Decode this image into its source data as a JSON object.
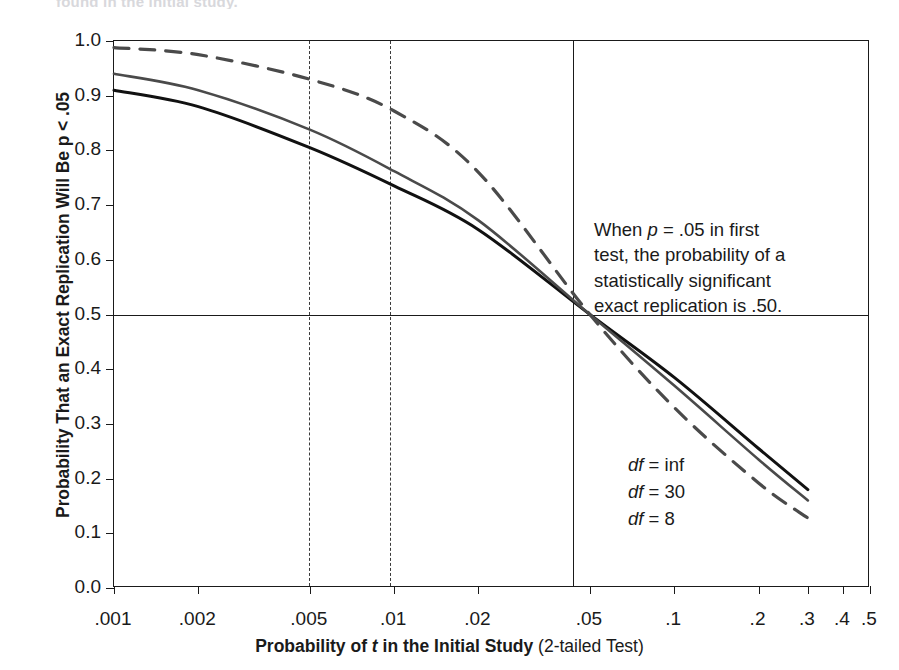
{
  "figure": {
    "cropped_top_text": "found in the initial study.",
    "annotation": "When p = .05 in first\ntest, the probability of a\nstatistically significant\nexact replication is .50.",
    "annotation_lead": "When ",
    "annotation_p": "p",
    "annotation_rest": " = .05 in first\ntest, the probability of a\nstatistically significant\nexact replication is .50."
  },
  "axis_titles": {
    "x_bold": "Probability of ",
    "x_italic": "t",
    "x_bold2": " in the Initial Study",
    "x_plain": " (2-tailed Test)",
    "y": "Probability That an Exact Replication Will Be p < .05"
  },
  "series_labels": {
    "inf": {
      "df": "df",
      "eq": " = inf"
    },
    "d30": {
      "df": "df",
      "eq": " = 30"
    },
    "d8": {
      "df": "df",
      "eq": " = 8"
    }
  },
  "chart_data": {
    "type": "line",
    "title": "",
    "xlabel": "Probability of t in the Initial Study (2-tailed Test)",
    "ylabel": "Probability That an Exact Replication Will Be p < .05",
    "xscale": "log",
    "xlim": [
      0.001,
      0.5
    ],
    "ylim": [
      0.0,
      1.0
    ],
    "grid": false,
    "legend_position": "inline-right-end",
    "x_tick_labels": [
      ".001",
      ".002",
      ".005",
      ".01",
      ".02",
      ".05",
      ".1",
      ".2",
      ".3",
      ".4",
      ".5"
    ],
    "x_tick_values": [
      0.001,
      0.002,
      0.005,
      0.01,
      0.02,
      0.05,
      0.1,
      0.2,
      0.3,
      0.4,
      0.5
    ],
    "y_tick_labels": [
      "1.0",
      "0.9",
      "0.8",
      "0.7",
      "0.6",
      "0.5",
      "0.4",
      "0.3",
      "0.2",
      "0.1",
      "0.0"
    ],
    "y_tick_values": [
      1.0,
      0.9,
      0.8,
      0.7,
      0.6,
      0.5,
      0.4,
      0.3,
      0.2,
      0.1,
      0.0
    ],
    "reference_lines": [
      {
        "orientation": "vertical",
        "value": 0.005,
        "style": "dashed"
      },
      {
        "orientation": "vertical",
        "value": 0.01,
        "style": "dashed"
      },
      {
        "orientation": "vertical",
        "value": 0.05,
        "style": "solid"
      },
      {
        "orientation": "horizontal",
        "value": 0.5,
        "style": "solid"
      }
    ],
    "x": [
      0.001,
      0.002,
      0.005,
      0.01,
      0.02,
      0.05,
      0.1,
      0.2,
      0.3
    ],
    "series": [
      {
        "name": "df = inf",
        "style": "solid",
        "color": "#111111",
        "width": 3.0,
        "values": [
          0.91,
          0.88,
          0.805,
          0.735,
          0.655,
          0.5,
          0.385,
          0.255,
          0.18
        ]
      },
      {
        "name": "df = 30",
        "style": "solid",
        "color": "#4a4a4a",
        "width": 2.6,
        "values": [
          0.94,
          0.91,
          0.838,
          0.762,
          0.672,
          0.5,
          0.37,
          0.235,
          0.16
        ]
      },
      {
        "name": "df = 8",
        "style": "dashed",
        "color": "#4a4a4a",
        "width": 3.2,
        "values": [
          0.988,
          0.975,
          0.93,
          0.872,
          0.76,
          0.5,
          0.33,
          0.192,
          0.128
        ]
      }
    ],
    "annotations": [
      {
        "text": "When p = .05 in first test, the probability of a statistically significant exact replication is .50.",
        "x": 0.06,
        "y": 0.73
      }
    ]
  }
}
